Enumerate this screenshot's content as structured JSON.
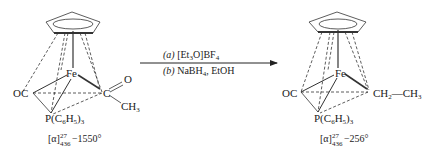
{
  "reaction": {
    "reactant": {
      "metal": "Fe",
      "ligand_left": "OC",
      "ligand_right_atom": "C",
      "ligand_right_oxygen": "O",
      "ligand_right_methyl": "CH",
      "ligand_right_methyl_sub": "3",
      "phosphine_prefix": "P(C",
      "phosphine_sub1": "6",
      "phosphine_mid": "H",
      "phosphine_sub2": "5",
      "phosphine_close": ")",
      "phosphine_sub3": "3",
      "rotation_prefix": "[α]",
      "rotation_sup": "27",
      "rotation_sub": "436",
      "rotation_value": "−1550°"
    },
    "conditions": {
      "step_a_label": "(a)",
      "step_a_reagent": "[Et",
      "step_a_sub": "3",
      "step_a_rest": "O]BF",
      "step_a_sub2": "4",
      "step_b_label": "(b)",
      "step_b_reagent": "NaBH",
      "step_b_sub": "4",
      "step_b_rest": ", EtOH"
    },
    "product": {
      "metal": "Fe",
      "ligand_left": "OC",
      "ligand_right_prefix": "CH",
      "ligand_right_sub": "2",
      "ligand_right_bond": "—CH",
      "ligand_right_sub2": "3",
      "phosphine_prefix": "P(C",
      "phosphine_sub1": "6",
      "phosphine_mid": "H",
      "phosphine_sub2": "5",
      "phosphine_close": ")",
      "phosphine_sub3": "3",
      "rotation_prefix": "[α]",
      "rotation_sup": "27",
      "rotation_sub": "436",
      "rotation_value": "−256°"
    }
  }
}
